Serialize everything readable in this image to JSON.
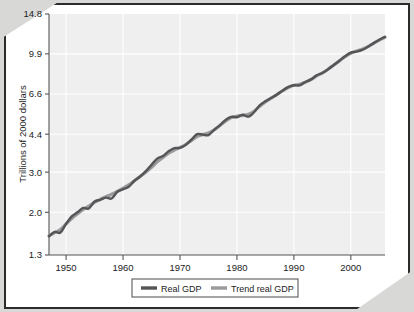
{
  "chart_data": {
    "type": "line",
    "title": "",
    "xlabel": "",
    "ylabel": "Trillions of 2000 dollars",
    "yscale": "log",
    "ylim": [
      1.3,
      14.8
    ],
    "xlim": [
      1947,
      2006
    ],
    "grid": true,
    "legend_position": "bottom-center",
    "ytick_labels": [
      "14.8",
      "9.9",
      "6.6",
      "4.4",
      "3.0",
      "2.0",
      "1.3"
    ],
    "ytick_values": [
      14.8,
      9.9,
      6.6,
      4.4,
      3.0,
      2.0,
      1.3
    ],
    "xtick_labels": [
      "1950",
      "1960",
      "1970",
      "1980",
      "1990",
      "2000"
    ],
    "xtick_values": [
      1950,
      1960,
      1970,
      1980,
      1990,
      2000
    ],
    "colors": {
      "real_gdp": "#555558",
      "trend_real_gdp": "#9a9a9c",
      "plot_background": "#efefef",
      "gridline": "#ffffff",
      "axis": "#555555",
      "page_border": "#2b2b2b"
    },
    "series": [
      {
        "name": "Real GDP",
        "color": "#555558",
        "x": [
          1947,
          1948,
          1949,
          1950,
          1951,
          1952,
          1953,
          1954,
          1955,
          1956,
          1957,
          1958,
          1959,
          1960,
          1961,
          1962,
          1963,
          1964,
          1965,
          1966,
          1967,
          1968,
          1969,
          1970,
          1971,
          1972,
          1973,
          1974,
          1975,
          1976,
          1977,
          1978,
          1979,
          1980,
          1981,
          1982,
          1983,
          1984,
          1985,
          1986,
          1987,
          1988,
          1989,
          1990,
          1991,
          1992,
          1993,
          1994,
          1995,
          1996,
          1997,
          1998,
          1999,
          2000,
          2001,
          2002,
          2003,
          2004,
          2005,
          2006
        ],
        "values": [
          1.57,
          1.64,
          1.63,
          1.78,
          1.92,
          2.0,
          2.09,
          2.08,
          2.23,
          2.27,
          2.32,
          2.3,
          2.46,
          2.52,
          2.59,
          2.75,
          2.87,
          3.03,
          3.23,
          3.44,
          3.53,
          3.7,
          3.82,
          3.83,
          3.95,
          4.16,
          4.4,
          4.38,
          4.36,
          4.6,
          4.81,
          5.08,
          5.24,
          5.22,
          5.35,
          5.25,
          5.49,
          5.89,
          6.13,
          6.34,
          6.55,
          6.83,
          7.08,
          7.21,
          7.2,
          7.45,
          7.65,
          7.97,
          8.16,
          8.47,
          8.85,
          9.24,
          9.67,
          10.03,
          10.12,
          10.3,
          10.63,
          11.03,
          11.41,
          11.74
        ]
      },
      {
        "name": "Trend real GDP",
        "color": "#9a9a9c",
        "x": [
          1947,
          1948,
          1949,
          1950,
          1951,
          1952,
          1953,
          1954,
          1955,
          1956,
          1957,
          1958,
          1959,
          1960,
          1961,
          1962,
          1963,
          1964,
          1965,
          1966,
          1967,
          1968,
          1969,
          1970,
          1971,
          1972,
          1973,
          1974,
          1975,
          1976,
          1977,
          1978,
          1979,
          1980,
          1981,
          1982,
          1983,
          1984,
          1985,
          1986,
          1987,
          1988,
          1989,
          1990,
          1991,
          1992,
          1993,
          1994,
          1995,
          1996,
          1997,
          1998,
          1999,
          2000,
          2001,
          2002,
          2003,
          2004,
          2005,
          2006
        ],
        "values": [
          1.58,
          1.63,
          1.68,
          1.78,
          1.88,
          1.97,
          2.06,
          2.13,
          2.21,
          2.28,
          2.34,
          2.4,
          2.47,
          2.55,
          2.64,
          2.75,
          2.87,
          3.0,
          3.15,
          3.33,
          3.48,
          3.63,
          3.75,
          3.85,
          3.96,
          4.13,
          4.3,
          4.38,
          4.46,
          4.6,
          4.8,
          5.02,
          5.2,
          5.28,
          5.32,
          5.38,
          5.55,
          5.84,
          6.1,
          6.33,
          6.56,
          6.82,
          7.05,
          7.21,
          7.28,
          7.44,
          7.64,
          7.92,
          8.17,
          8.47,
          8.84,
          9.22,
          9.62,
          9.96,
          10.18,
          10.38,
          10.65,
          11.0,
          11.38,
          11.72
        ]
      }
    ]
  },
  "axis": {
    "ylabel": "Trillions of 2000 dollars"
  },
  "legend": {
    "items": [
      {
        "label": "Real GDP",
        "color": "#555558"
      },
      {
        "label": "Trend real GDP",
        "color": "#9a9a9c"
      }
    ]
  }
}
